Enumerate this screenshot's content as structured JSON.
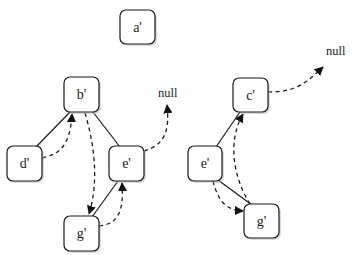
{
  "diagram": {
    "title": "",
    "nodes": [
      {
        "id": "a",
        "label": "a'",
        "x": 120,
        "y": 10,
        "w": 35,
        "h": 34
      },
      {
        "id": "b",
        "label": "b'",
        "x": 64,
        "y": 77,
        "w": 35,
        "h": 35
      },
      {
        "id": "d",
        "label": "d'",
        "x": 7,
        "y": 146,
        "w": 35,
        "h": 35
      },
      {
        "id": "e1",
        "label": "e'",
        "x": 109,
        "y": 146,
        "w": 35,
        "h": 35
      },
      {
        "id": "g1",
        "label": "g'",
        "x": 64,
        "y": 216,
        "w": 35,
        "h": 35
      },
      {
        "id": "c",
        "label": "c'",
        "x": 233,
        "y": 78,
        "w": 35,
        "h": 34
      },
      {
        "id": "e2",
        "label": "e'",
        "x": 188,
        "y": 146,
        "w": 34,
        "h": 35
      },
      {
        "id": "g2",
        "label": "g'",
        "x": 244,
        "y": 204,
        "w": 35,
        "h": 34
      }
    ],
    "null_labels": [
      {
        "id": "null-left",
        "text": "null",
        "x": 158,
        "y": 97
      },
      {
        "id": "null-right",
        "text": "null",
        "x": 326,
        "y": 55
      }
    ],
    "tree_edges": [
      {
        "from": "b",
        "to": "d"
      },
      {
        "from": "b",
        "to": "e1"
      },
      {
        "from": "e1",
        "to": "g1"
      },
      {
        "from": "c",
        "to": "e2"
      },
      {
        "from": "e2",
        "to": "g2"
      }
    ],
    "thread_arrows": [
      {
        "from": "d",
        "to": "b",
        "style": "dashed"
      },
      {
        "from": "b",
        "to": "g1",
        "style": "dashed"
      },
      {
        "from": "g1",
        "to": "e1",
        "style": "dashed"
      },
      {
        "from": "e1",
        "to": "null-left",
        "style": "dashed"
      },
      {
        "from": "c",
        "to": "null-right",
        "style": "dashed"
      },
      {
        "from": "e2",
        "to": "g2",
        "style": "dashed"
      },
      {
        "from": "g2",
        "to": "c",
        "style": "dashed"
      }
    ]
  }
}
